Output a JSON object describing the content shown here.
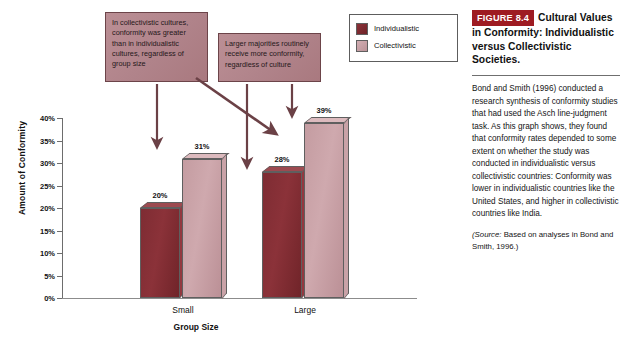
{
  "chart_data": {
    "type": "bar",
    "title": "",
    "xlabel": "Group Size",
    "ylabel": "Amount of Conformity",
    "categories": [
      "Small",
      "Large"
    ],
    "ylim": [
      0,
      40
    ],
    "ytick_labels": [
      "0%",
      "5%",
      "10%",
      "15%",
      "20%",
      "25%",
      "30%",
      "35%",
      "40%"
    ],
    "ytick_values": [
      0,
      5,
      10,
      15,
      20,
      25,
      30,
      35,
      40
    ],
    "grid": false,
    "legend_position": "top-right",
    "series": [
      {
        "name": "Individualistic",
        "color": "#8b3239",
        "values": [
          20,
          28
        ],
        "value_labels": [
          "20%",
          "28%"
        ]
      },
      {
        "name": "Collectivistic",
        "color": "#c49ca1",
        "values": [
          31,
          39
        ],
        "value_labels": [
          "31%",
          "39%"
        ]
      }
    ],
    "annotations": [
      "In collectivistic cultures, conformity was greater than in individualistic cultures, regardless of group size",
      "Larger majorities routinely receive more conformity, regardless of culture"
    ]
  },
  "callouts": [
    {
      "text": "In collectivistic cultures, conformity was greater than in individualistic cultures, regardless of group size"
    },
    {
      "text": "Larger majorities routinely receive more conformity, regardless of culture"
    }
  ],
  "legend": {
    "items": [
      {
        "label": "Individualistic",
        "color": "#8b3239"
      },
      {
        "label": "Collectivistic",
        "color": "#c49ca1"
      }
    ]
  },
  "figure": {
    "badge": "FIGURE 8.4",
    "title": "Cultural Values in Conformity: Individualistic versus Collectivistic Societies.",
    "body": "Bond and Smith (1996) conducted a research synthesis of conformity studies that had used the Asch line-judgment task. As this graph shows, they found that conformity rates depended to some extent on whether the study was conducted in individualistic versus collectivistic countries: Conformity was lower in individualistic countries like the United States, and higher in collectivistic countries like India.",
    "source_prefix": "(Source:",
    "source_text": " Based on analyses in Bond and Smith, 1996.)",
    "badge_color": "#9e1b22"
  }
}
